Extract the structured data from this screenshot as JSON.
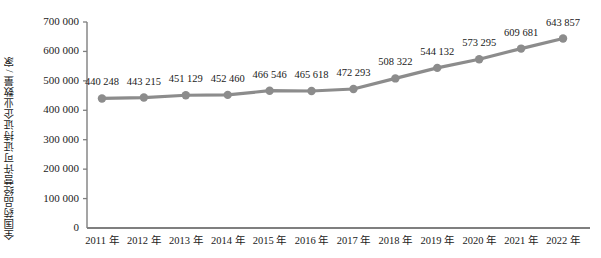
{
  "chart_data": {
    "type": "line",
    "title": "",
    "xlabel": "",
    "ylabel": "全国药品经营许可证持证企业数量 / 家",
    "categories": [
      "2011 年",
      "2012 年",
      "2013 年",
      "2014 年",
      "2015 年",
      "2016 年",
      "2017 年",
      "2018 年",
      "2019 年",
      "2020 年",
      "2021 年",
      "2022 年"
    ],
    "values": [
      440248,
      443215,
      451129,
      452460,
      466546,
      465618,
      472293,
      508322,
      544132,
      573295,
      609681,
      643857
    ],
    "value_labels": [
      "440 248",
      "443 215",
      "451 129",
      "452 460",
      "466 546",
      "465 618",
      "472 293",
      "508 322",
      "544 132",
      "573 295",
      "609 681",
      "643 857"
    ],
    "ylim": [
      0,
      700000
    ],
    "ytick_values": [
      0,
      100000,
      200000,
      300000,
      400000,
      500000,
      600000,
      700000
    ],
    "ytick_labels": [
      "0",
      "100 000",
      "200 000",
      "300 000",
      "400 000",
      "500 000",
      "600 000",
      "700 000"
    ],
    "grid": false,
    "legend": null,
    "series_color": "#8c8c8c",
    "axis_color": "#7f7f7f",
    "marker": "circle"
  }
}
